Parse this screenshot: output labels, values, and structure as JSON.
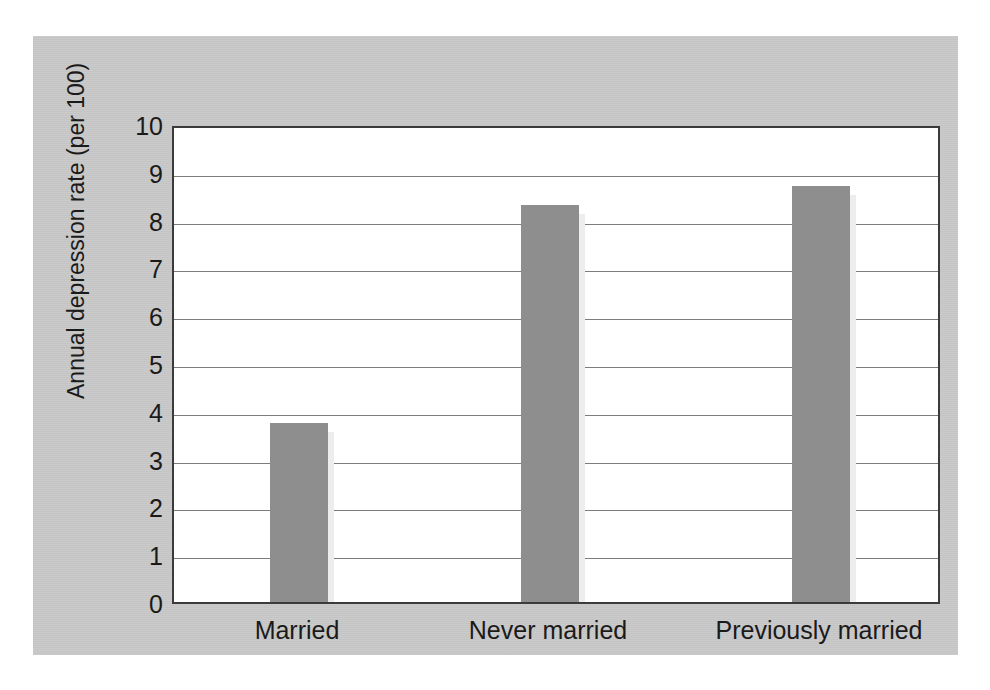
{
  "chart_data": {
    "type": "bar",
    "title": "",
    "xlabel": "",
    "ylabel": "Annual depression rate (per 100)",
    "categories": [
      "Married",
      "Never married",
      "Previously married"
    ],
    "values": [
      3.75,
      8.3,
      8.7
    ],
    "ylim": [
      0,
      10
    ],
    "ytick_labels": [
      "0",
      "1",
      "2",
      "3",
      "4",
      "5",
      "6",
      "7",
      "8",
      "9",
      "10"
    ],
    "ytick_values": [
      0,
      1,
      2,
      3,
      4,
      5,
      6,
      7,
      8,
      9,
      10
    ],
    "grid": true,
    "grid_axis": "y",
    "legend": null,
    "legend_position": "none",
    "bar_color": "#8e8e8e",
    "bar_shadow_color": "#ededed",
    "panel_color": "#c8c8c8",
    "plot_background": "#ffffff",
    "axis_color": "#3b3b3b",
    "gridline_color": "#7d7d7d",
    "text_color": "#1a1a1a"
  },
  "figure": {
    "background": "#ffffff",
    "panel_background": "#c8c8c8"
  }
}
